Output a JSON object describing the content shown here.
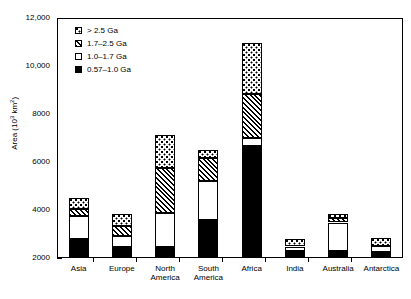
{
  "chart_data": {
    "type": "bar",
    "subtype": "stacked-bar",
    "title": "",
    "xlabel": "",
    "ylabel": "Area (10³ km²)",
    "ylabel_base": "Area (10",
    "ylabel_exp": "3",
    "ylabel_tail": " km",
    "ylabel_exp2": "2",
    "ylabel_close": ")",
    "ylim": [
      2000,
      12000
    ],
    "yticks": [
      2000,
      4000,
      6000,
      8000,
      10000,
      12000
    ],
    "ytick_labels": [
      "2000",
      "4000",
      "6000",
      "8000",
      "10,000",
      "12,000"
    ],
    "yminor_ticks": [
      3000,
      5000,
      7000,
      9000,
      11000
    ],
    "grid": false,
    "legend_position": "top-left",
    "categories": [
      "Asia",
      "Europe",
      "North America",
      "South America",
      "Africa",
      "India",
      "Australia",
      "Antarctica"
    ],
    "category_labels": [
      "Asia",
      "Europe",
      "North\nAmerica",
      "South\nAmerica",
      "Africa",
      "India",
      "Australia",
      "Antarctica"
    ],
    "series": [
      {
        "name": "0.57–1.0 Ga",
        "pattern": "solid-black",
        "cumulative_top": [
          2800,
          2440,
          2450,
          3580,
          6670,
          2300,
          2300,
          2260
        ],
        "values": [
          800,
          440,
          450,
          1580,
          4670,
          300,
          300,
          260
        ]
      },
      {
        "name": "1.0–1.7 Ga",
        "pattern": "white",
        "cumulative_top": [
          3760,
          2900,
          3880,
          5220,
          6980,
          2480,
          3480,
          2500
        ],
        "values": [
          960,
          460,
          1430,
          1640,
          310,
          180,
          1180,
          240
        ]
      },
      {
        "name": "1.7–2.5 Ga",
        "pattern": "hatched",
        "cumulative_top": [
          4060,
          3340,
          5750,
          6160,
          8830,
          2480,
          3680,
          2500
        ],
        "values": [
          300,
          440,
          1870,
          940,
          1850,
          0,
          200,
          0
        ]
      },
      {
        "name": "> 2.5 Ga",
        "pattern": "stippled",
        "cumulative_top": [
          4500,
          3850,
          7120,
          6500,
          10960,
          2800,
          3840,
          2830
        ],
        "values": [
          440,
          510,
          1370,
          340,
          2130,
          320,
          160,
          330
        ]
      }
    ],
    "totals": [
      4500,
      3850,
      7120,
      6500,
      10960,
      2800,
      3840,
      2830
    ]
  },
  "legend": {
    "items": [
      {
        "label": "> 2.5 Ga",
        "swatch": "stippled"
      },
      {
        "label": "1.7–2.5 Ga",
        "swatch": "hatched"
      },
      {
        "label": "1.0–1.7 Ga",
        "swatch": "white"
      },
      {
        "label": "0.57–1.0 Ga",
        "swatch": "solid-black"
      }
    ]
  }
}
